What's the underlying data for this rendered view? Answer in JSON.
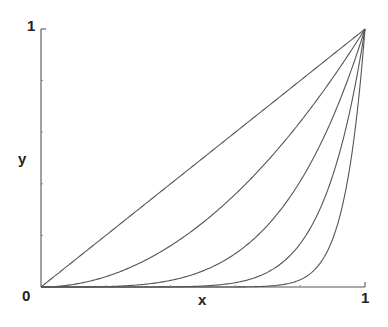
{
  "chart_data": {
    "type": "line",
    "title": "",
    "xlabel": "x",
    "ylabel": "y",
    "xlim": [
      0,
      1
    ],
    "ylim": [
      0,
      1
    ],
    "grid": false,
    "legend": null,
    "tick_labels": {
      "x_min": "0",
      "x_max": "1",
      "y_max": "1"
    },
    "minor_ticks": [
      0.2,
      0.4,
      0.6,
      0.8
    ],
    "series": [
      {
        "name": "y = x",
        "exponent": 1
      },
      {
        "name": "y = x^2",
        "exponent": 2
      },
      {
        "name": "y = x^4",
        "exponent": 4
      },
      {
        "name": "y = x^8",
        "exponent": 8
      },
      {
        "name": "y = x^16",
        "exponent": 16
      }
    ]
  },
  "plot": {
    "x0": 41,
    "y0": 287,
    "x1": 365,
    "y1": 29,
    "color": "#555555"
  }
}
